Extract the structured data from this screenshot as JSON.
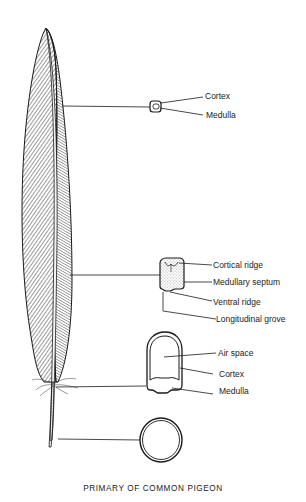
{
  "caption": "PRIMARY OF COMMON PIGEON",
  "sections": [
    {
      "id": "distal",
      "labels": [
        "Cortex",
        "Medulla"
      ]
    },
    {
      "id": "middle",
      "labels": [
        "Cortical ridge",
        "Medullary septum",
        "Ventral ridge",
        "Longitudinal grove"
      ]
    },
    {
      "id": "proximal",
      "labels": [
        "Air space",
        "Cortex",
        "Medulla"
      ]
    },
    {
      "id": "calamus",
      "labels": []
    }
  ],
  "colors": {
    "ink": "#1a1a1a",
    "background": "#ffffff"
  }
}
